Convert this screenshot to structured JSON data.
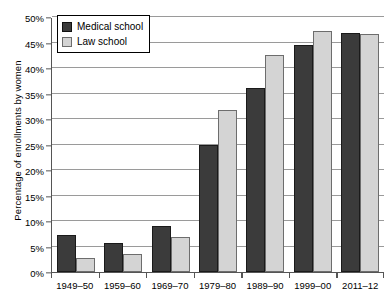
{
  "chart_data": {
    "type": "bar",
    "title": "",
    "xlabel": "",
    "ylabel": "Percentage of enrollments by women",
    "categories": [
      "1949–50",
      "1959–60",
      "1969–70",
      "1979–80",
      "1989–90",
      "1999–00",
      "2011–12"
    ],
    "series": [
      {
        "name": "Medical school",
        "color": "#3b3b3b",
        "values": [
          7.3,
          5.7,
          9.0,
          25.0,
          36.0,
          44.5,
          46.8
        ]
      },
      {
        "name": "Law school",
        "color": "#d4d4d4",
        "values": [
          2.7,
          3.5,
          6.9,
          31.8,
          42.5,
          47.3,
          46.7
        ]
      }
    ],
    "ylim": [
      0,
      50
    ],
    "ytick_values": [
      0,
      5,
      10,
      15,
      20,
      25,
      30,
      35,
      40,
      45,
      50
    ],
    "ytick_labels": [
      "0%",
      "5%",
      "10%",
      "15%",
      "20%",
      "25%",
      "30%",
      "35%",
      "40%",
      "45%",
      "50%"
    ],
    "grid": true,
    "legend_position": "top-left"
  },
  "legend": {
    "items": [
      {
        "label": "Medical school",
        "swatch": "medical"
      },
      {
        "label": "Law school",
        "swatch": "law"
      }
    ]
  }
}
